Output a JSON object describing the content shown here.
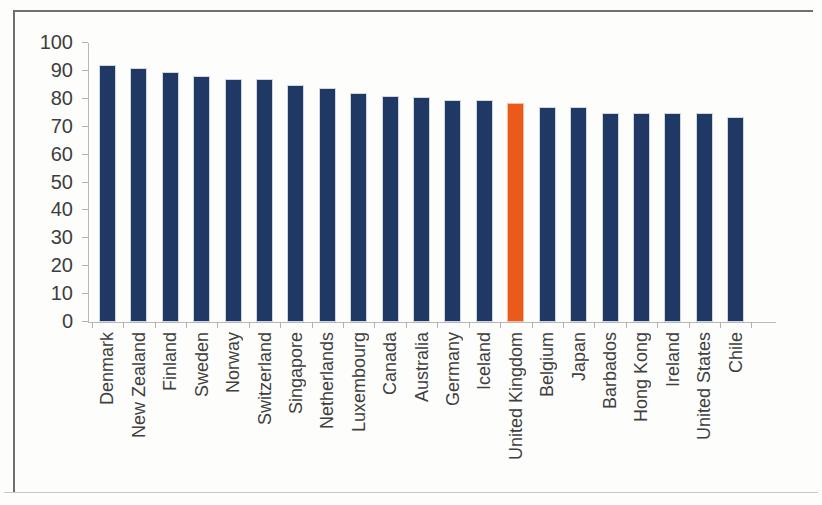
{
  "chart_data": {
    "type": "bar",
    "title": "",
    "subtitle": "",
    "xlabel": "",
    "ylabel": "",
    "ylim": [
      0,
      100
    ],
    "yticks": [
      0,
      10,
      20,
      30,
      40,
      50,
      60,
      70,
      80,
      90,
      100
    ],
    "grid": false,
    "legend": null,
    "highlight_category": "United Kingdom",
    "colors": {
      "bar": "#1F3864",
      "highlight_bar": "#EA5A1B",
      "axis": "#B0B0B0",
      "text": "#3D3D3D",
      "frame": "#6F6F6F"
    },
    "categories": [
      "Denmark",
      "New Zealand",
      "Finland",
      "Sweden",
      "Norway",
      "Switzerland",
      "Singapore",
      "Netherlands",
      "Luxembourg",
      "Canada",
      "Australia",
      "Germany",
      "Iceland",
      "United Kingdom",
      "Belgium",
      "Japan",
      "Barbados",
      "Hong Kong",
      "Ireland",
      "United States",
      "Chile"
    ],
    "values": [
      92,
      91,
      89.5,
      88,
      87,
      87,
      85,
      84,
      82,
      81,
      80.5,
      79.5,
      79.5,
      78.5,
      77,
      77,
      75,
      75,
      75,
      75,
      73.5
    ]
  }
}
